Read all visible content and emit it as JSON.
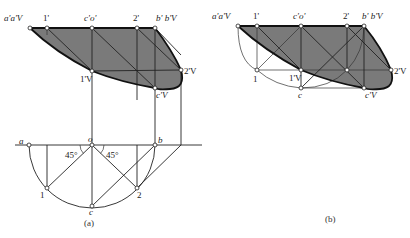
{
  "figure_a": {
    "caption": "(a)",
    "top_view_labels": {
      "a_prime": "a'a'V",
      "one_prime": "1'",
      "c_prime_o_prime": "c'o'",
      "two_prime": "2'",
      "b_prime": "b' b'V",
      "one_prime_v": "1'V",
      "two_prime_v": "2'V",
      "c_prime_v": "c'V"
    },
    "plan_labels": {
      "a": "a",
      "o": "o",
      "b": "b",
      "one": "1",
      "two": "2",
      "c": "c",
      "angle_left": "45°",
      "angle_right": "45°"
    }
  },
  "figure_b": {
    "caption": "(b)",
    "labels": {
      "a_prime": "a'a'V",
      "one_prime": "1'",
      "c_prime_o_prime": "c'o'",
      "two_prime": "2'",
      "b_prime": "b' b'V",
      "one": "1",
      "one_prime_v": "1'V",
      "c": "c",
      "two_prime_v": "2'V",
      "c_prime_v": "c'V"
    }
  },
  "colors": {
    "shade": "#7a7a7a",
    "line": "#222222",
    "background": "#ffffff"
  }
}
